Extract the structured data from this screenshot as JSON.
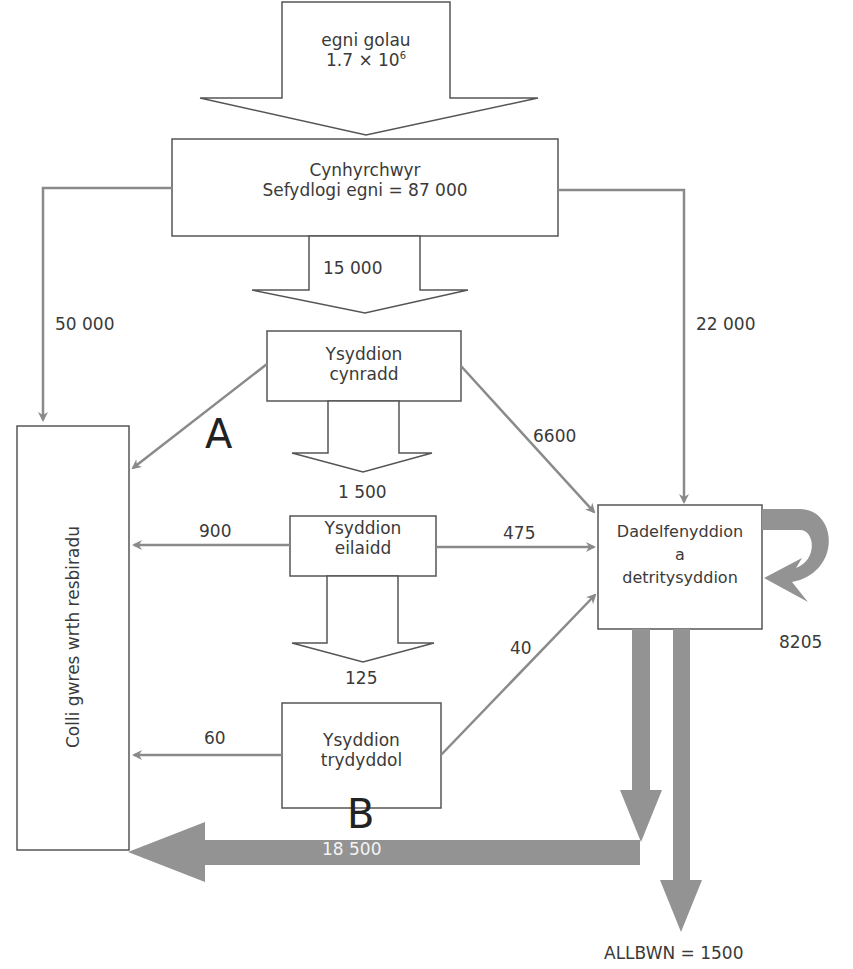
{
  "diagram": {
    "type": "energy-flow",
    "input": {
      "label": "egni golau",
      "value": "1.7 × 10",
      "exponent": "6"
    },
    "nodes": {
      "producers": {
        "line1": "Cynhyrchwyr",
        "line2": "Sefydlogi egni = 87 000"
      },
      "primary": {
        "line1": "Ysyddion",
        "line2": "cynradd"
      },
      "secondary": {
        "line1": "Ysyddion",
        "line2": "eilaidd"
      },
      "tertiary": {
        "line1": "Ysyddion",
        "line2": "trydyddol"
      },
      "decomposers": {
        "line1": "Dadelfenyddion",
        "line2": "a",
        "line3": "detritysyddion"
      },
      "respiration": {
        "label": "Colli gwres wrth resbiradu"
      }
    },
    "flows": {
      "producers_to_primary": "15 000",
      "primary_to_secondary": "1 500",
      "secondary_to_tertiary": "125",
      "producers_to_respiration": "50 000",
      "producers_to_decomposers": "22 000",
      "primary_to_decomposers": "6600",
      "secondary_to_respiration": "900",
      "secondary_to_decomposers": "475",
      "tertiary_to_respiration": "60",
      "tertiary_to_decomposers": "40",
      "decomposers_loop": "8205",
      "decomposers_to_respiration": "18 500",
      "output": "ALLBWN = 1500"
    },
    "markers": {
      "a": "A",
      "b": "B"
    }
  },
  "colors": {
    "line": "#8a8a8a",
    "box": "#555555",
    "thick_arrow": "#939393"
  }
}
